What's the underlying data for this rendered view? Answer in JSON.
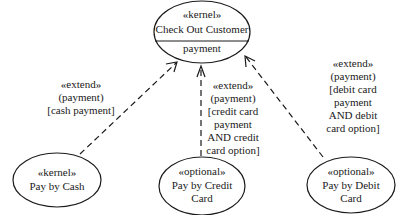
{
  "diagram": {
    "type": "uml-use-case",
    "base_use_case": {
      "stereotype": "«kernel»",
      "name": "Check Out Customer",
      "extension_point": "payment"
    },
    "extending_use_cases": [
      {
        "stereotype": "«kernel»",
        "name_lines": [
          "Pay by Cash"
        ],
        "relation": {
          "stereotype": "«extend»",
          "extension_point": "(payment)",
          "condition_lines": [
            "[cash payment]"
          ]
        }
      },
      {
        "stereotype": "«optional»",
        "name_lines": [
          "Pay by Credit",
          "Card"
        ],
        "relation": {
          "stereotype": "«extend»",
          "extension_point": "(payment)",
          "condition_lines": [
            "[credit card",
            "payment",
            "AND credit",
            "card option]"
          ]
        }
      },
      {
        "stereotype": "«optional»",
        "name_lines": [
          "Pay by Debit",
          "Card"
        ],
        "relation": {
          "stereotype": "«extend»",
          "extension_point": "(payment)",
          "condition_lines": [
            "[debit card",
            "payment",
            "AND debit",
            "card option]"
          ]
        }
      }
    ],
    "colors": {
      "line": "#1a1a1a",
      "background": "#ffffff"
    }
  }
}
